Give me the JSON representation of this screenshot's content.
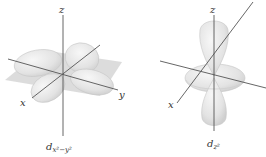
{
  "diagrams": [
    {
      "name": "dx2-y2-orbital",
      "axis_labels": {
        "z": "z",
        "x": "x",
        "y": "y"
      },
      "caption_main": "d",
      "caption_sub": "x²−y²"
    },
    {
      "name": "dz2-orbital",
      "axis_labels": {
        "z": "z",
        "x": "x"
      },
      "caption_main": "d",
      "caption_sub": "z²"
    }
  ],
  "colors": {
    "lobe_fill": "#e6e6e6",
    "lobe_stroke": "#c8c8c8",
    "plane_fill": "#d4d4d4",
    "axis": "#555555",
    "label": "#333333"
  }
}
